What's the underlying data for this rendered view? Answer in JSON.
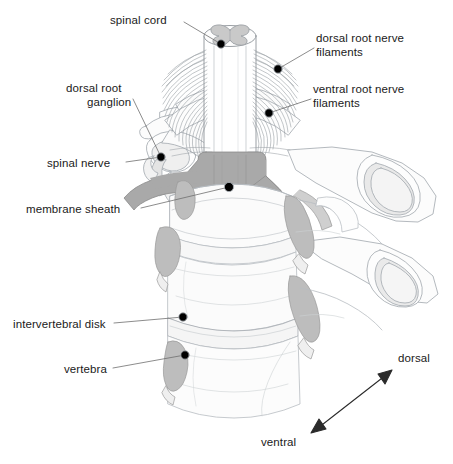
{
  "figure": {
    "background_color": "#ffffff",
    "line_color": "#9aa0a6",
    "dark_line_color": "#3a3a3a",
    "membrane_sheath_fill": "#a9a9a9",
    "nerve_gray_fill": "#b4b4b4",
    "bone_fill": "#fbfbfb",
    "text_color": "#1a1a1a",
    "dot_color": "#000000"
  },
  "labels": {
    "spinal_cord": "spinal cord",
    "dorsal_root_nerve_filaments_line1": "dorsal root nerve",
    "dorsal_root_nerve_filaments_line2": "filaments",
    "dorsal_root_ganglion_line1": "dorsal root",
    "dorsal_root_ganglion_line2": "ganglion",
    "ventral_root_nerve_filaments_line1": "ventral root nerve",
    "ventral_root_nerve_filaments_line2": "filaments",
    "spinal_nerve": "spinal nerve",
    "membrane_sheath": "membrane sheath",
    "intervertebral_disk": "intervertebral disk",
    "vertebra": "vertebra",
    "dorsal": "dorsal",
    "ventral": "ventral"
  },
  "callouts": [
    {
      "key": "spinal_cord",
      "dot_x": 221,
      "dot_y": 44,
      "text_x": 110,
      "text_y": 14,
      "align": "left"
    },
    {
      "key": "dorsal_root_filaments",
      "dot_x": 278,
      "dot_y": 69,
      "text_x": 317,
      "text_y": 31,
      "align": "left"
    },
    {
      "key": "ventral_root_filaments",
      "dot_x": 269,
      "dot_y": 113,
      "text_x": 314,
      "text_y": 82,
      "align": "left"
    },
    {
      "key": "dorsal_root_ganglion",
      "dot_x": 161,
      "dot_y": 157,
      "text_x": 66,
      "text_y": 82,
      "align": "left"
    },
    {
      "key": "spinal_nerve",
      "dot_x": 161,
      "dot_y": 157,
      "text_x": 47,
      "text_y": 158,
      "align": "left"
    },
    {
      "key": "membrane_sheath",
      "dot_x": 229,
      "dot_y": 187,
      "text_x": 25,
      "text_y": 205,
      "align": "left"
    },
    {
      "key": "intervertebral_disk",
      "dot_x": 183,
      "dot_y": 317,
      "text_x": 13,
      "text_y": 319,
      "align": "left"
    },
    {
      "key": "vertebra",
      "dot_x": 185,
      "dot_y": 355,
      "text_x": 64,
      "text_y": 364,
      "align": "left"
    }
  ],
  "orientation_arrow": {
    "ventral_end": {
      "x": 312,
      "y": 433
    },
    "dorsal_end": {
      "x": 392,
      "y": 370
    },
    "dorsal_label_x": 398,
    "dorsal_label_y": 352,
    "ventral_label_x": 261,
    "ventral_label_y": 436
  }
}
